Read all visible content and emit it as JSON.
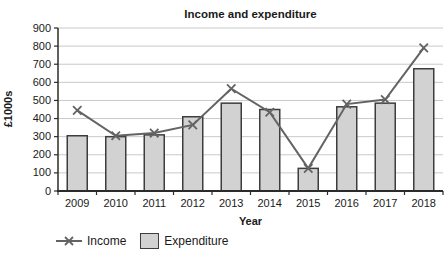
{
  "chart_data": {
    "type": "bar+line",
    "title": "Income and expenditure",
    "xlabel": "Year",
    "ylabel": "£1000s",
    "categories": [
      "2009",
      "2010",
      "2011",
      "2012",
      "2013",
      "2014",
      "2015",
      "2016",
      "2017",
      "2018"
    ],
    "series": [
      {
        "name": "Income",
        "type": "line",
        "marker": "x",
        "color": "#636363",
        "values": [
          445,
          305,
          320,
          365,
          565,
          435,
          125,
          480,
          505,
          790
        ]
      },
      {
        "name": "Expenditure",
        "type": "bar",
        "fill": "#d2d2d2",
        "border": "#3d3d3d",
        "values": [
          305,
          300,
          310,
          410,
          485,
          450,
          125,
          465,
          485,
          675
        ]
      }
    ],
    "ylim": [
      0,
      900
    ],
    "ytick_step": 100,
    "grid": "horizontal",
    "legend_position": "bottom-left"
  },
  "colors": {
    "grid": "#c9c9c9",
    "axis": "#2b2b2b",
    "tick_text": "#1a1a1a",
    "background": "#ffffff"
  }
}
